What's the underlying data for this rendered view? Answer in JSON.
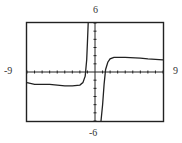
{
  "chart_data": {
    "type": "line",
    "title": "",
    "xlabel": "",
    "ylabel": "",
    "xlim": [
      -9,
      9
    ],
    "ylim": [
      -6,
      6
    ],
    "xscale_ticks": 1,
    "yscale_ticks": 1,
    "grid": false,
    "window_labels": {
      "ymax": "6",
      "ymin": "-6",
      "xmin": "-9",
      "xmax": "9"
    },
    "series": [
      {
        "name": "left-branch",
        "x": [
          -9,
          -8,
          -6,
          -4,
          -3,
          -2,
          -1.6,
          -1.3,
          -1.1,
          -1.0,
          -0.9
        ],
        "y": [
          -1.3,
          -1.5,
          -1.5,
          -1.7,
          -1.7,
          -1.6,
          -1.3,
          -0.5,
          1.5,
          3.5,
          6
        ]
      },
      {
        "name": "right-branch",
        "x": [
          0.8,
          1.0,
          1.2,
          1.4,
          1.7,
          2.0,
          2.5,
          4,
          6,
          7,
          9
        ],
        "y": [
          -6,
          -4,
          -1.5,
          0.3,
          1.2,
          1.6,
          1.8,
          1.8,
          1.7,
          1.6,
          1.5
        ]
      }
    ]
  },
  "labels": {
    "top": "6",
    "bottom": "-6",
    "left": "-9",
    "right": "9"
  }
}
